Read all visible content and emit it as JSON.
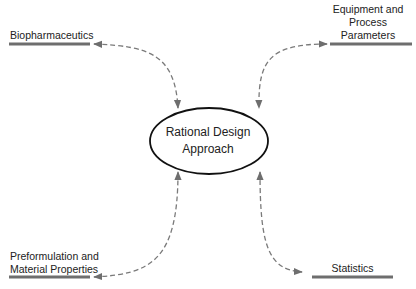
{
  "diagram": {
    "type": "hub-and-spoke",
    "center": {
      "label_line1": "Rational Design",
      "label_line2": "Approach"
    },
    "nodes": [
      {
        "id": "biopharmaceutics",
        "line1": "Biopharmaceutics",
        "position": "top-left"
      },
      {
        "id": "equipment",
        "line1": "Equipment and",
        "line2": "Process",
        "line3": "Parameters",
        "position": "top-right"
      },
      {
        "id": "preformulation",
        "line1": "Preformulation and",
        "line2": "Material Properties",
        "position": "bottom-left"
      },
      {
        "id": "statistics",
        "line1": "Statistics",
        "position": "bottom-right"
      }
    ],
    "edges": [
      {
        "from": "center",
        "to": "biopharmaceutics",
        "style": "dashed",
        "direction": "bidirectional"
      },
      {
        "from": "center",
        "to": "equipment",
        "style": "dashed",
        "direction": "bidirectional"
      },
      {
        "from": "center",
        "to": "preformulation",
        "style": "dashed",
        "direction": "bidirectional"
      },
      {
        "from": "center",
        "to": "statistics",
        "style": "dashed",
        "direction": "bidirectional"
      }
    ],
    "colors": {
      "bar": "#6e6e6e",
      "connector": "#7a7a7a",
      "ellipse_stroke": "#111111",
      "text": "#222222"
    }
  }
}
